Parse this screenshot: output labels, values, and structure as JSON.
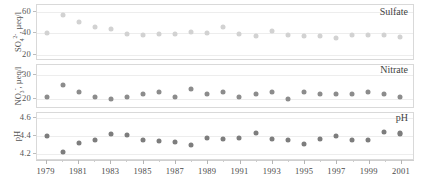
{
  "chart_data": {
    "type": "scatter",
    "title": "",
    "xlabel": "",
    "x": [
      1979,
      1980,
      1981,
      1982,
      1983,
      1984,
      1985,
      1986,
      1987,
      1988,
      1989,
      1990,
      1991,
      1992,
      1993,
      1994,
      1995,
      1996,
      1997,
      1998,
      1999,
      2000,
      2001
    ],
    "xlim": [
      1978.4,
      2001.8
    ],
    "xtick_labels": [
      "1979",
      "1981",
      "1983",
      "1985",
      "1987",
      "1989",
      "1991",
      "1993",
      "1995",
      "1997",
      "1999",
      "2001"
    ],
    "xtick_values": [
      1979,
      1981,
      1983,
      1985,
      1987,
      1989,
      1991,
      1993,
      1995,
      1997,
      1999,
      2001
    ],
    "xminor_values": [
      1980,
      1982,
      1984,
      1986,
      1988,
      1990,
      1992,
      1994,
      1996,
      1998,
      2000
    ],
    "grid": true,
    "legend_position": "inside-right",
    "panels": [
      {
        "name": "sulfate",
        "label": "Sulfate",
        "ylabel": "SO4 2-, µeq/l",
        "ylabel_html": "SO<sub>4</sub><sup>2-</sup>, µeq/l",
        "ylim": [
          14,
          66
        ],
        "yticks": [
          20,
          40,
          60
        ],
        "ytick_labels": [
          "20",
          "40",
          "60"
        ],
        "marker_color": "#d2d2d2",
        "marker_size": 5,
        "values": [
          40,
          57,
          50,
          46,
          44,
          39,
          38,
          39,
          39,
          41,
          40,
          46,
          39,
          37,
          42,
          38,
          37,
          37,
          35,
          38,
          38,
          38,
          36
        ]
      },
      {
        "name": "nitrate",
        "label": "Nitrate",
        "ylabel": "NO3 -, µeq/l",
        "ylabel_html": "NO<sub>3</sub><sup>-</sup>, µeq/l",
        "ylim": [
          16,
          34
        ],
        "yticks": [
          20,
          30
        ],
        "ytick_labels": [
          "20",
          "30"
        ],
        "marker_color": "#8c8c8c",
        "marker_size": 5,
        "values": [
          21,
          26,
          23,
          21,
          20,
          21,
          22,
          23,
          21,
          24,
          22,
          23,
          21,
          22,
          23,
          20,
          23,
          22,
          22,
          22,
          23,
          22,
          21
        ]
      },
      {
        "name": "ph",
        "label": "pH",
        "ylabel": "pH",
        "ylabel_html": "pH",
        "ylim": [
          4.12,
          4.66
        ],
        "yticks": [
          4.2,
          4.4,
          4.6
        ],
        "ytick_labels": [
          "4.2",
          "4.4",
          "4.6"
        ],
        "marker_color": "#7d7d7d",
        "marker_size": 5,
        "values": [
          4.4,
          4.22,
          4.32,
          4.36,
          4.42,
          4.41,
          4.36,
          4.35,
          4.33,
          4.3,
          4.38,
          4.37,
          4.38,
          4.43,
          4.37,
          4.36,
          4.31,
          4.37,
          4.4,
          4.36,
          4.36,
          4.45,
          4.44,
          4.42
        ]
      }
    ]
  },
  "colors": {
    "axis": "#cfcfcf",
    "grid": "#ededed",
    "text": "#4a4a4a",
    "sulfate_marker": "#d2d2d2",
    "nitrate_marker": "#8c8c8c",
    "ph_marker": "#7d7d7d"
  }
}
